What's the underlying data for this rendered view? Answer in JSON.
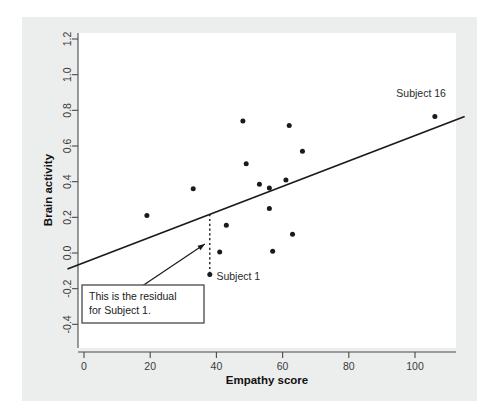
{
  "chart_data": {
    "type": "scatter",
    "title": "",
    "xlabel": "Empathy score",
    "ylabel": "Brain activity",
    "xlim": [
      -5,
      115
    ],
    "ylim": [
      -0.5,
      1.3
    ],
    "xticks": [
      0,
      20,
      40,
      60,
      80,
      100
    ],
    "xtick_labels": [
      "0",
      "20",
      "40",
      "60",
      "80",
      "100"
    ],
    "yticks": [
      -0.4,
      -0.2,
      0.0,
      0.2,
      0.4,
      0.6,
      0.8,
      1.0,
      1.2
    ],
    "ytick_labels": [
      "-0.4",
      "-0.2",
      "0.0",
      "0.2",
      "0.4",
      "0.6",
      "0.8",
      "1.0",
      "1.2"
    ],
    "grid": false,
    "legend": "none",
    "points": [
      {
        "x": 19,
        "y": 0.21,
        "label": ""
      },
      {
        "x": 33,
        "y": 0.36,
        "label": ""
      },
      {
        "x": 38,
        "y": -0.12,
        "label": "Subject 1"
      },
      {
        "x": 41,
        "y": 0.005,
        "label": ""
      },
      {
        "x": 43,
        "y": 0.155,
        "label": ""
      },
      {
        "x": 48,
        "y": 0.74,
        "label": ""
      },
      {
        "x": 49,
        "y": 0.5,
        "label": ""
      },
      {
        "x": 53,
        "y": 0.385,
        "label": ""
      },
      {
        "x": 56,
        "y": 0.365,
        "label": ""
      },
      {
        "x": 56,
        "y": 0.25,
        "label": ""
      },
      {
        "x": 57,
        "y": 0.01,
        "label": ""
      },
      {
        "x": 61,
        "y": 0.41,
        "label": ""
      },
      {
        "x": 62,
        "y": 0.715,
        "label": ""
      },
      {
        "x": 63,
        "y": 0.105,
        "label": ""
      },
      {
        "x": 66,
        "y": 0.57,
        "label": ""
      },
      {
        "x": 106,
        "y": 0.765,
        "label": "Subject 16"
      }
    ],
    "regression_line": {
      "x_start": -5,
      "y_start": -0.09,
      "x_end": 115,
      "y_end": 0.765,
      "slope": 0.00713,
      "intercept": -0.0543
    },
    "residual_marker": {
      "x": 38,
      "y_fitted": 0.218,
      "y_observed": -0.12,
      "style": "dotted"
    },
    "annotations": [
      {
        "name": "residual-callout",
        "line1": "This is the residual",
        "line2": "for Subject 1.",
        "arrow_from_x": 16,
        "arrow_from_y": -0.205,
        "arrow_to_x": 36.5,
        "arrow_to_y": 0.05
      },
      {
        "name": "subject-1-label",
        "text": "Subject 1",
        "x": 40,
        "y": -0.13
      },
      {
        "name": "subject-16-label",
        "text": "Subject 16",
        "x": 101,
        "y": 0.875
      }
    ],
    "colors": {
      "panel_background": "#eceded",
      "plot_background": "#ffffff",
      "point": "#1a1a1a",
      "line": "#1a1a1a",
      "axis": "#4a4a4a",
      "annotation_border": "#555555"
    }
  }
}
